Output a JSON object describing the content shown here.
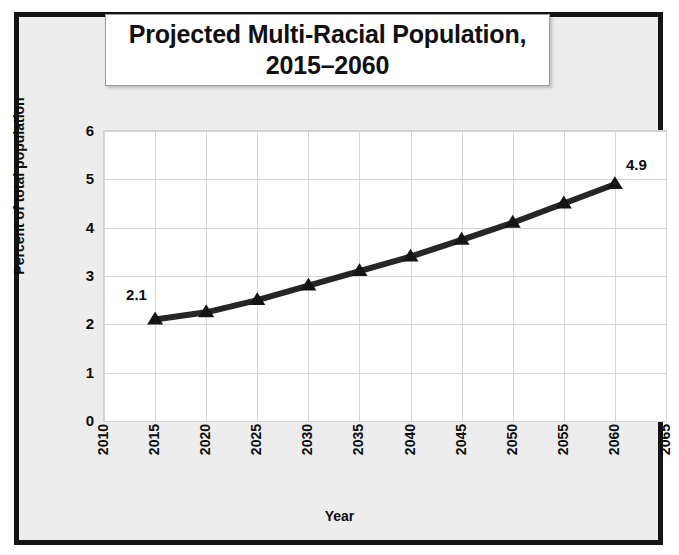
{
  "chart_data": {
    "type": "line",
    "title": "Projected Multi-Racial Population, 2015–2060",
    "title_lines": [
      "Projected Multi-Racial Population,",
      "2015–2060"
    ],
    "xlabel": "Year",
    "ylabel": "Percent of total population",
    "x": [
      2015,
      2020,
      2025,
      2030,
      2035,
      2040,
      2045,
      2050,
      2055,
      2060
    ],
    "values": [
      2.1,
      2.25,
      2.5,
      2.8,
      3.1,
      3.4,
      3.75,
      4.1,
      4.5,
      4.9
    ],
    "point_labels": [
      {
        "x": 2015,
        "value": 2.1,
        "text": "2.1"
      },
      {
        "x": 2060,
        "value": 4.9,
        "text": "4.9"
      }
    ],
    "xlim": [
      2010,
      2065
    ],
    "ylim": [
      0,
      6
    ],
    "xticks": [
      "2010",
      "2015",
      "2020",
      "2025",
      "2030",
      "2035",
      "2040",
      "2045",
      "2050",
      "2055",
      "2060",
      "2065"
    ],
    "xtick_values": [
      2010,
      2015,
      2020,
      2025,
      2030,
      2035,
      2040,
      2045,
      2050,
      2055,
      2060,
      2065
    ],
    "yticks": [
      "0",
      "1",
      "2",
      "3",
      "4",
      "5",
      "6"
    ],
    "ytick_values": [
      0,
      1,
      2,
      3,
      4,
      5,
      6
    ],
    "grid": true,
    "legend": false,
    "series_color": "#262626",
    "marker": "triangle",
    "marker_color": "#141414",
    "grid_color": "#d6d6d6",
    "plot_background": "#ffffff",
    "figure_background": "#ededed",
    "frame_color": "#141414",
    "text_color": "#0d0d0d"
  }
}
